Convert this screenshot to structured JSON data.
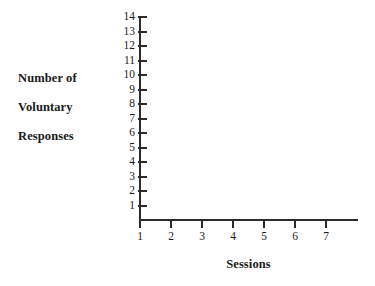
{
  "chart_data": {
    "type": "line",
    "title": "",
    "subtitle": "",
    "xlabel": "Sessions",
    "ylabel": "Number of Voluntary Responses",
    "ylabel_lines": [
      "Number of",
      "Voluntary",
      "Responses"
    ],
    "x": [
      1,
      2,
      3,
      4,
      5,
      6,
      7
    ],
    "xticklabels": [
      "1",
      "2",
      "3",
      "4",
      "5",
      "6",
      "7"
    ],
    "yticks": [
      1,
      2,
      3,
      4,
      5,
      6,
      7,
      8,
      9,
      10,
      11,
      12,
      13,
      14
    ],
    "yticklabels": [
      "1",
      "2",
      "3",
      "4",
      "5",
      "6",
      "7",
      "8",
      "9",
      "10",
      "11",
      "12",
      "13",
      "14"
    ],
    "xlim": [
      1,
      7
    ],
    "ylim": [
      1,
      14
    ],
    "grid": false,
    "legend": null,
    "series": [],
    "annotations": [],
    "note": "Blank/unplotted axes template: axes, ticks and labels only, no data points or lines drawn.",
    "colors": {
      "axis": "#2b2b2b",
      "text": "#1a1a1a",
      "background": "#ffffff"
    }
  }
}
